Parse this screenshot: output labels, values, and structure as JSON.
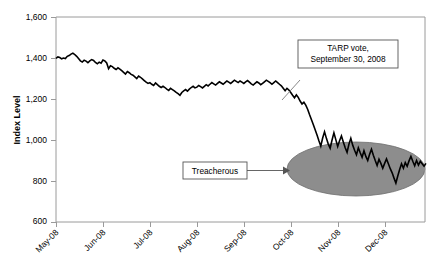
{
  "chart_data": {
    "type": "line",
    "title": "",
    "xlabel": "",
    "ylabel": "Index Level",
    "ylim": [
      600,
      1600
    ],
    "grid": false,
    "legend": "none",
    "y_ticks": [
      "600",
      "800",
      "1,000",
      "1,200",
      "1,400",
      "1,600"
    ],
    "y_tick_values": [
      600,
      800,
      1000,
      1200,
      1400,
      1600
    ],
    "x_ticks": [
      "May-08",
      "Jun-08",
      "Jul-08",
      "Aug-08",
      "Sep-08",
      "Oct-08",
      "Nov-08",
      "Dec-08"
    ],
    "x_tick_months": [
      0,
      1,
      2,
      3,
      4,
      5,
      6,
      7
    ],
    "series": [
      {
        "name": "Index Level",
        "x": [
          0.0,
          0.04,
          0.08,
          0.12,
          0.16,
          0.2,
          0.24,
          0.28,
          0.32,
          0.36,
          0.4,
          0.44,
          0.48,
          0.52,
          0.56,
          0.6,
          0.64,
          0.68,
          0.72,
          0.76,
          0.8,
          0.84,
          0.88,
          0.92,
          0.96,
          1.0,
          1.04,
          1.08,
          1.12,
          1.16,
          1.2,
          1.24,
          1.28,
          1.32,
          1.36,
          1.4,
          1.44,
          1.48,
          1.52,
          1.56,
          1.6,
          1.64,
          1.68,
          1.72,
          1.76,
          1.8,
          1.84,
          1.88,
          1.92,
          1.96,
          2.0,
          2.04,
          2.08,
          2.12,
          2.16,
          2.2,
          2.24,
          2.28,
          2.32,
          2.36,
          2.4,
          2.44,
          2.48,
          2.52,
          2.56,
          2.6,
          2.64,
          2.68,
          2.72,
          2.76,
          2.8,
          2.84,
          2.88,
          2.92,
          2.96,
          3.0,
          3.04,
          3.08,
          3.12,
          3.16,
          3.2,
          3.24,
          3.28,
          3.32,
          3.36,
          3.4,
          3.44,
          3.48,
          3.52,
          3.56,
          3.6,
          3.64,
          3.68,
          3.72,
          3.76,
          3.8,
          3.84,
          3.88,
          3.92,
          3.96,
          4.0,
          4.04,
          4.08,
          4.12,
          4.16,
          4.2,
          4.24,
          4.28,
          4.32,
          4.36,
          4.4,
          4.44,
          4.48,
          4.52,
          4.56,
          4.6,
          4.64,
          4.68,
          4.72,
          4.76,
          4.8,
          4.84,
          4.88,
          4.92,
          4.96,
          5.0,
          5.04,
          5.08,
          5.12,
          5.16,
          5.2,
          5.24,
          5.28,
          5.32,
          5.36,
          5.4,
          5.44,
          5.48,
          5.52,
          5.56,
          5.6,
          5.64,
          5.68,
          5.72,
          5.76,
          5.8,
          5.84,
          5.88,
          5.92,
          5.96,
          6.0,
          6.04,
          6.08,
          6.12,
          6.16,
          6.2,
          6.24,
          6.28,
          6.32,
          6.36,
          6.4,
          6.44,
          6.48,
          6.52,
          6.56,
          6.6,
          6.64,
          6.68,
          6.72,
          6.76,
          6.8,
          6.84,
          6.88,
          6.92,
          6.96,
          7.0,
          7.04,
          7.08,
          7.12,
          7.16,
          7.2,
          7.24,
          7.28,
          7.32,
          7.36,
          7.4,
          7.44,
          7.48,
          7.52,
          7.56,
          7.6,
          7.64,
          7.68,
          7.72,
          7.76,
          7.8,
          7.84,
          7.88
        ],
        "values": [
          1398,
          1405,
          1402,
          1396,
          1400,
          1397,
          1408,
          1412,
          1419,
          1424,
          1417,
          1408,
          1397,
          1386,
          1380,
          1389,
          1385,
          1377,
          1386,
          1392,
          1388,
          1378,
          1372,
          1380,
          1375,
          1390,
          1386,
          1376,
          1348,
          1362,
          1358,
          1350,
          1344,
          1352,
          1346,
          1338,
          1330,
          1322,
          1334,
          1328,
          1320,
          1316,
          1308,
          1300,
          1312,
          1306,
          1298,
          1290,
          1282,
          1276,
          1280,
          1272,
          1266,
          1278,
          1270,
          1262,
          1256,
          1262,
          1256,
          1248,
          1242,
          1252,
          1246,
          1240,
          1232,
          1226,
          1218,
          1232,
          1240,
          1246,
          1238,
          1248,
          1256,
          1262,
          1254,
          1258,
          1266,
          1260,
          1254,
          1262,
          1270,
          1264,
          1272,
          1280,
          1274,
          1268,
          1276,
          1284,
          1278,
          1272,
          1280,
          1288,
          1282,
          1276,
          1284,
          1292,
          1286,
          1280,
          1288,
          1282,
          1276,
          1284,
          1290,
          1282,
          1274,
          1268,
          1276,
          1284,
          1278,
          1270,
          1276,
          1284,
          1292,
          1286,
          1280,
          1272,
          1280,
          1288,
          1280,
          1272,
          1264,
          1252,
          1240,
          1252,
          1244,
          1232,
          1218,
          1206,
          1220,
          1208,
          1190,
          1176,
          1184,
          1170,
          1150,
          1124,
          1100,
          1076,
          1050,
          1024,
          996,
          970,
          1010,
          1040,
          1008,
          980,
          960,
          1000,
          1035,
          1002,
          968,
          996,
          1020,
          990,
          962,
          940,
          980,
          1008,
          975,
          950,
          928,
          962,
          938,
          916,
          948,
          920,
          900,
          930,
          955,
          926,
          900,
          876,
          906,
          886,
          862,
          886,
          908,
          884,
          860,
          840,
          814,
          790,
          824,
          856,
          884,
          862,
          890,
          872,
          898,
          920,
          896,
          874,
          900,
          878,
          896,
          884,
          872,
          886
        ]
      }
    ],
    "annotations": [
      {
        "label": "TARP vote,\nSeptember 30, 2008",
        "line1": "TARP vote,",
        "line2": "September 30, 2008",
        "anchor_x": 4.82,
        "anchor_y": 1200
      },
      {
        "label": "Treacherous",
        "anchor_x": 5.6,
        "anchor_y": 900
      }
    ],
    "highlight_region": {
      "shape": "ellipse",
      "x_center": 5.95,
      "y_center": 925,
      "x_radius": 1.47,
      "y_radius": 255,
      "color": "#8d8d8d"
    }
  },
  "callouts": {
    "tarp_line1": "TARP vote,",
    "tarp_line2": "September 30, 2008",
    "treacherous": "Treacherous"
  },
  "axes": {
    "y_title": "Index Level"
  },
  "colors": {
    "line": "#000000",
    "ellipse": "#8d8d8d",
    "axis": "#9a9a9a",
    "callout_border": "#555555"
  }
}
